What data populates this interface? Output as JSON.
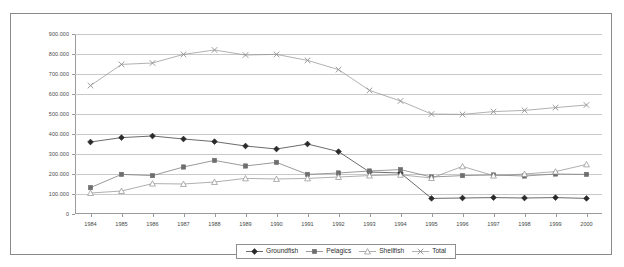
{
  "chart_data": {
    "type": "line",
    "title": "",
    "xlabel": "",
    "ylabel": "",
    "ylim": [
      0,
      900000
    ],
    "yticks": [
      "0",
      "100.000",
      "200.000",
      "300.000",
      "400.000",
      "500.000",
      "600.000",
      "700.000",
      "800.000",
      "900.000"
    ],
    "ytick_values": [
      0,
      100000,
      200000,
      300000,
      400000,
      500000,
      600000,
      700000,
      800000,
      900000
    ],
    "grid": true,
    "legend_position": "bottom",
    "categories": [
      "1984",
      "1985",
      "1986",
      "1987",
      "1988",
      "1989",
      "1990",
      "1991",
      "1992",
      "1993",
      "1994",
      "1995",
      "1996",
      "1997",
      "1998",
      "1999",
      "2000"
    ],
    "series": [
      {
        "name": "Groundfish",
        "marker": "filled-diamond",
        "color": "#2b2b2b",
        "values": [
          360000,
          382000,
          390000,
          375000,
          362000,
          340000,
          325000,
          350000,
          312000,
          210000,
          205000,
          78000,
          80000,
          82000,
          80000,
          82000,
          78000
        ]
      },
      {
        "name": "Pelagics",
        "marker": "filled-square",
        "color": "#6e6e6e",
        "values": [
          132000,
          198000,
          192000,
          235000,
          268000,
          240000,
          258000,
          198000,
          205000,
          215000,
          222000,
          185000,
          192000,
          195000,
          190000,
          200000,
          198000
        ]
      },
      {
        "name": "Shellfish",
        "marker": "open-triangle",
        "color": "#8c8c8c",
        "values": [
          105000,
          115000,
          152000,
          150000,
          160000,
          178000,
          175000,
          178000,
          185000,
          192000,
          196000,
          180000,
          238000,
          192000,
          200000,
          212000,
          248000
        ]
      },
      {
        "name": "Total",
        "marker": "cross",
        "color": "#8f8f8f",
        "values": [
          642000,
          748000,
          755000,
          798000,
          820000,
          795000,
          798000,
          768000,
          722000,
          618000,
          565000,
          500000,
          498000,
          512000,
          518000,
          532000,
          545000
        ]
      }
    ]
  },
  "legend": {
    "items": [
      {
        "label": "Groundfish"
      },
      {
        "label": "Pelagics"
      },
      {
        "label": "Shellfish"
      },
      {
        "label": "Total"
      }
    ]
  }
}
